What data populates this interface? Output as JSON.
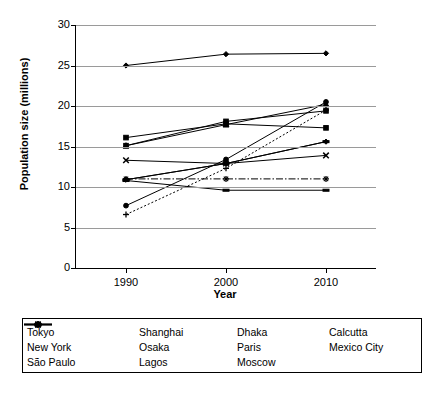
{
  "chart_data": {
    "type": "line",
    "title": "",
    "xlabel": "Year",
    "ylabel": "Population size (millions)",
    "x": [
      1990,
      2000,
      2010
    ],
    "xtick_labels": [
      "1990",
      "2000",
      "2010"
    ],
    "ytick_labels": [
      "0",
      "5",
      "10",
      "15",
      "20",
      "25",
      "30"
    ],
    "yticks": [
      0,
      5,
      10,
      15,
      20,
      25,
      30
    ],
    "ylim": [
      0,
      30
    ],
    "xlim": [
      1985,
      2015
    ],
    "grid": "horizontal",
    "legend_position": "bottom",
    "series": [
      {
        "name": "Tokyo",
        "marker": "diamond",
        "line": "solid",
        "values": [
          25.0,
          26.4,
          26.5
        ]
      },
      {
        "name": "New York",
        "marker": "square",
        "line": "solid",
        "values": [
          16.1,
          17.8,
          17.3
        ]
      },
      {
        "name": "São Paulo",
        "marker": "triangle",
        "line": "solid",
        "values": [
          15.1,
          17.7,
          20.2
        ]
      },
      {
        "name": "Shanghai",
        "marker": "x",
        "line": "solid",
        "values": [
          13.3,
          12.9,
          13.9
        ]
      },
      {
        "name": "Osaka",
        "marker": "star",
        "line": "dashdot",
        "values": [
          11.0,
          11.0,
          11.0
        ]
      },
      {
        "name": "Lagos",
        "marker": "circle",
        "line": "solid",
        "values": [
          7.7,
          13.4,
          20.5
        ]
      },
      {
        "name": "Dhaka",
        "marker": "plus",
        "line": "dotted",
        "values": [
          6.6,
          12.3,
          19.5
        ]
      },
      {
        "name": "Paris",
        "marker": "dash",
        "line": "solid",
        "values": [
          10.8,
          9.6,
          9.6
        ]
      },
      {
        "name": "Moscow",
        "marker": "dash",
        "line": "solid",
        "values": [
          10.9,
          12.9,
          15.6
        ]
      },
      {
        "name": "Calcutta",
        "marker": "diamond",
        "line": "solid",
        "values": [
          10.9,
          12.9,
          15.6
        ]
      },
      {
        "name": "Mexico City",
        "marker": "square",
        "line": "solid",
        "values": [
          15.1,
          18.1,
          19.4
        ]
      }
    ]
  },
  "legend": {
    "entries": [
      {
        "label": "Tokyo"
      },
      {
        "label": "Shanghai"
      },
      {
        "label": "Dhaka"
      },
      {
        "label": "Calcutta"
      },
      {
        "label": "New York"
      },
      {
        "label": "Osaka"
      },
      {
        "label": "Paris"
      },
      {
        "label": "Mexico City"
      },
      {
        "label": "São Paulo"
      },
      {
        "label": "Lagos"
      },
      {
        "label": "Moscow"
      }
    ]
  },
  "colors": {
    "line": "#000000",
    "grid": "#9a9a9a",
    "axis": "#000000",
    "background": "#ffffff"
  }
}
